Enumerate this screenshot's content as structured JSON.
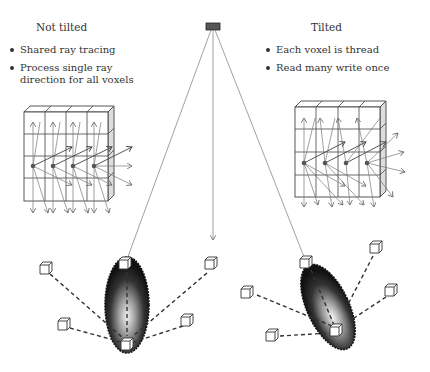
{
  "left_panel": {
    "title": "Not tilted",
    "bullets": [
      "Shared ray tracing",
      "Process single ray direction for all voxels"
    ]
  },
  "right_panel": {
    "title": "Tilted",
    "bullets": [
      "Each voxel is thread",
      "Read many write once"
    ]
  },
  "elements": {
    "source": "x-ray-source-icon",
    "left_grid": "voxel-grid-not-tilted",
    "right_grid": "voxel-grid-tilted",
    "left_specimen": "ellipsoid-specimen-vertical",
    "right_specimen": "ellipsoid-specimen-tilted",
    "detector_cubes": "detector-cube-icon"
  },
  "colors": {
    "line": "#888888",
    "dark": "#333333",
    "specimen_dark": "#1a1a1a",
    "specimen_light": "#e8e8e8"
  }
}
